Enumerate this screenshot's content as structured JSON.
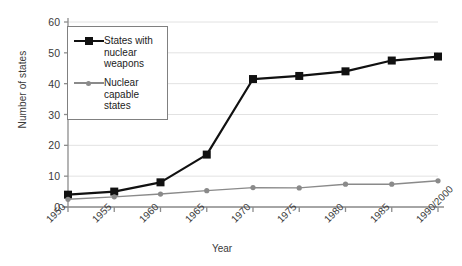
{
  "chart_data": {
    "type": "line",
    "title": "",
    "xlabel": "Year",
    "ylabel": "Number of states",
    "categories": [
      "1950",
      "1955",
      "1960",
      "1965",
      "1970",
      "1975",
      "1980",
      "1985",
      "1990/2000"
    ],
    "ylim": [
      0,
      60
    ],
    "yticks": [
      0,
      10,
      20,
      30,
      40,
      50,
      60
    ],
    "grid": true,
    "legend_position": "upper-left-inside",
    "series": [
      {
        "name": "States with nuclear weapons",
        "legend_label": "States with\nnuclear\nweapons",
        "color": "#111111",
        "marker": "square",
        "values": [
          4,
          5,
          8,
          17,
          41.5,
          42.5,
          44,
          47.5,
          48.8
        ]
      },
      {
        "name": "Nuclear capable states",
        "legend_label": "Nuclear\ncapable\nstates",
        "color": "#8a8a8a",
        "marker": "circle",
        "values": [
          2.5,
          3.3,
          4.2,
          5.3,
          6.3,
          6.2,
          7.4,
          7.4,
          8.5
        ]
      }
    ]
  },
  "axis": {
    "y_label": "Number of states",
    "x_label": "Year"
  }
}
